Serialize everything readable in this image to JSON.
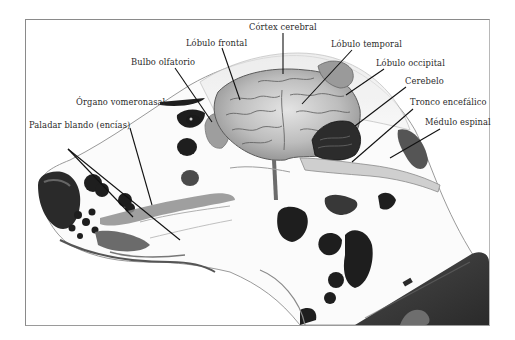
{
  "diagram": {
    "colors": {
      "frame": "#8a8a8a",
      "background": "#ffffff",
      "spots": "#1e1e1e",
      "brain": "#b9b9b9",
      "cerebellum": "#2c2c2c",
      "collar": "#3d3d3d",
      "leader_lines": "#111111"
    },
    "labels": [
      {
        "id": "cortex",
        "text": "Córtex cerebral",
        "x": 249,
        "y": 27
      },
      {
        "id": "frontal",
        "text": "Lóbulo frontal",
        "x": 186,
        "y": 42
      },
      {
        "id": "temporal",
        "text": "Lóbulo temporal",
        "x": 331,
        "y": 43
      },
      {
        "id": "olfactory",
        "text": "Bulbo olfatorio",
        "x": 131,
        "y": 61
      },
      {
        "id": "occipital",
        "text": "Lóbulo occipital",
        "x": 376,
        "y": 62
      },
      {
        "id": "cerebellum",
        "text": "Cerebelo",
        "x": 405,
        "y": 80
      },
      {
        "id": "vomeronasal",
        "text": "Órgano vomeronasal",
        "x": 76,
        "y": 101
      },
      {
        "id": "brainstem",
        "text": "Tronco encefálico",
        "x": 410,
        "y": 101
      },
      {
        "id": "spinal",
        "text": "Médulo espinal",
        "x": 425,
        "y": 121
      },
      {
        "id": "soft_palate",
        "text": "Paladar blando (encías)",
        "x": 29,
        "y": 124
      }
    ]
  }
}
